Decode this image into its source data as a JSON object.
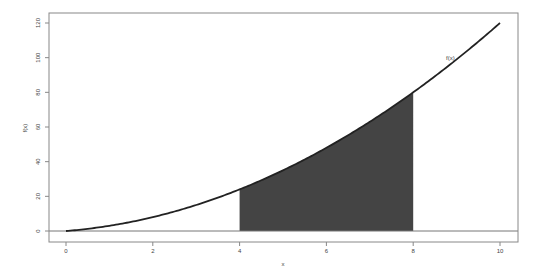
{
  "chart_data": {
    "type": "area",
    "title": "",
    "xlabel": "x",
    "ylabel": "f(x)",
    "function": "x^2 + 2x",
    "curve_label": "f(x)",
    "xlim": [
      0,
      10
    ],
    "ylim": [
      0,
      120
    ],
    "x_ticks": [
      0,
      2,
      4,
      6,
      8,
      10
    ],
    "y_ticks": [
      0,
      20,
      40,
      60,
      80,
      100,
      120
    ],
    "x": [
      0,
      1,
      2,
      3,
      4,
      5,
      6,
      7,
      8,
      9,
      10
    ],
    "series": [
      {
        "name": "f(x)",
        "values": [
          0,
          3,
          8,
          15,
          24,
          35,
          48,
          63,
          80,
          99,
          120
        ]
      }
    ],
    "shaded_region": {
      "x_from": 4,
      "x_to": 8,
      "color": "#444444"
    },
    "hline": 0,
    "grid": false,
    "legend": "none"
  },
  "colors": {
    "curve": "#222222",
    "shade": "#444444",
    "axis": "#777777"
  }
}
